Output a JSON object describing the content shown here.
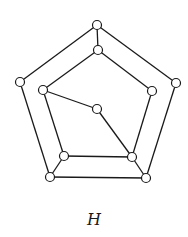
{
  "graph": {
    "label": "H",
    "node_radius": 4.5,
    "colors": {
      "stroke": "#1a1a1a",
      "node_fill": "#ffffff",
      "background": "#ffffff"
    },
    "nodes": [
      {
        "id": "outer-top",
        "x": 97,
        "y": 25
      },
      {
        "id": "outer-right",
        "x": 176,
        "y": 83
      },
      {
        "id": "outer-bottom-right",
        "x": 146,
        "y": 178
      },
      {
        "id": "outer-bottom-left",
        "x": 50,
        "y": 177
      },
      {
        "id": "outer-left",
        "x": 20,
        "y": 82
      },
      {
        "id": "inner-top",
        "x": 98,
        "y": 50
      },
      {
        "id": "inner-right",
        "x": 152,
        "y": 91
      },
      {
        "id": "inner-bottom-right",
        "x": 132,
        "y": 157
      },
      {
        "id": "inner-bottom-left",
        "x": 64,
        "y": 156
      },
      {
        "id": "inner-left",
        "x": 43,
        "y": 90
      },
      {
        "id": "center",
        "x": 97,
        "y": 109
      }
    ],
    "edges": [
      [
        "outer-top",
        "outer-right"
      ],
      [
        "outer-right",
        "outer-bottom-right"
      ],
      [
        "outer-bottom-right",
        "outer-bottom-left"
      ],
      [
        "outer-bottom-left",
        "outer-left"
      ],
      [
        "outer-left",
        "outer-top"
      ],
      [
        "inner-top",
        "inner-right"
      ],
      [
        "inner-right",
        "inner-bottom-right"
      ],
      [
        "inner-bottom-right",
        "inner-bottom-left"
      ],
      [
        "inner-bottom-left",
        "inner-left"
      ],
      [
        "inner-left",
        "inner-top"
      ],
      [
        "outer-top",
        "inner-top"
      ],
      [
        "outer-bottom-right",
        "inner-bottom-right"
      ],
      [
        "outer-bottom-left",
        "inner-bottom-left"
      ],
      [
        "inner-left",
        "center"
      ],
      [
        "center",
        "inner-bottom-right"
      ]
    ]
  }
}
